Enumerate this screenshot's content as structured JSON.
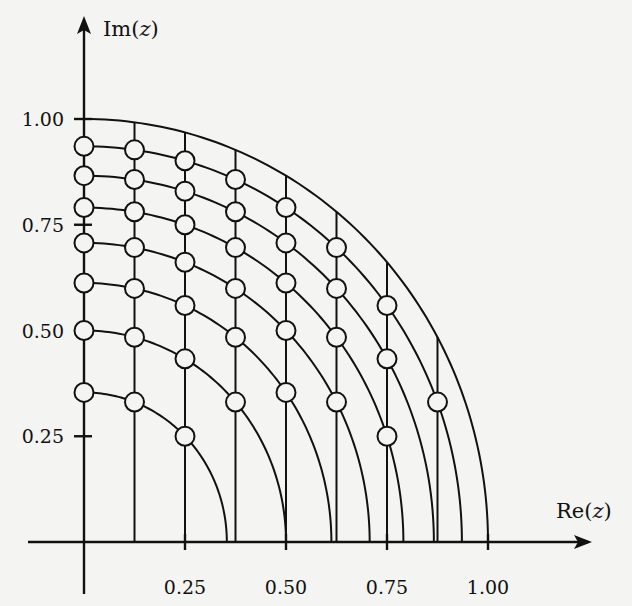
{
  "figure": {
    "type": "pole-location-grid",
    "x_axis": {
      "label_prefix": "Re(",
      "label_var": "z",
      "label_suffix": ")",
      "ticks": [
        {
          "value": 0.25,
          "label": "0.25"
        },
        {
          "value": 0.5,
          "label": "0.50"
        },
        {
          "value": 0.75,
          "label": "0.75"
        },
        {
          "value": 1.0,
          "label": "1.00"
        }
      ]
    },
    "y_axis": {
      "label_prefix": "Im(",
      "label_var": "z",
      "label_suffix": ")",
      "ticks": [
        {
          "value": 0.25,
          "label": "0.25"
        },
        {
          "value": 0.5,
          "label": "0.50"
        },
        {
          "value": 0.75,
          "label": "0.75"
        },
        {
          "value": 1.0,
          "label": "1.00"
        }
      ]
    },
    "arcs_radius_squared": [
      0.125,
      0.25,
      0.375,
      0.5,
      0.625,
      0.75,
      0.875,
      1.0
    ],
    "vertical_lines_re": [
      0.125,
      0.25,
      0.375,
      0.5,
      0.625,
      0.75,
      0.875
    ],
    "marker_columns_re": [
      0,
      0.125,
      0.25,
      0.375,
      0.5,
      0.625,
      0.75,
      0.875
    ],
    "marker_radius_squared": [
      0.125,
      0.25,
      0.375,
      0.5,
      0.625,
      0.75,
      0.875
    ],
    "colors": {
      "ink": "#111111",
      "paper": "#f4f4f2"
    }
  }
}
